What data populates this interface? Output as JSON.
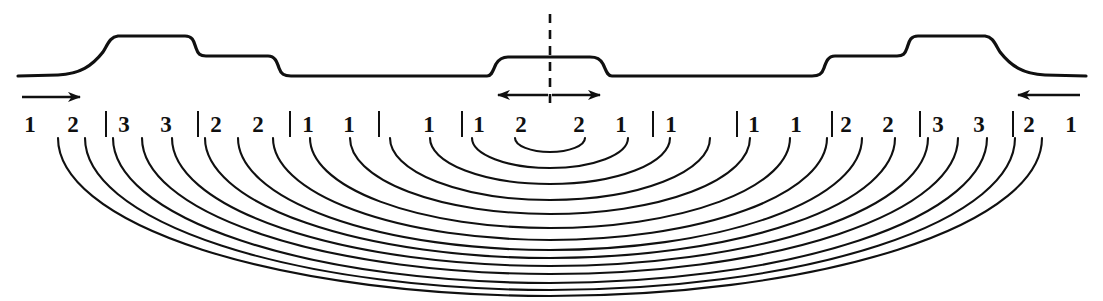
{
  "figure": {
    "background_color": "#ffffff",
    "ink_color": "#101010",
    "width": 1103,
    "height": 301
  },
  "surface_profile": {
    "name": "terrain-profile",
    "baseline_y": 76,
    "levels": {
      "baseline": 76,
      "low_step": 56,
      "high_step": 36,
      "center_bump": 57
    },
    "description": "Symmetric profile: outer baseline, gradual rise to high plateau, step down to mid plateau, long baseline, small central raised block, then mirrored on the right"
  },
  "centerline": {
    "name": "symmetry-axis",
    "x": 550,
    "y_top": 14,
    "y_bottom": 106,
    "style": "dashed"
  },
  "arrows": [
    {
      "name": "left-flow-arrow",
      "direction": "right",
      "x1": 22,
      "x2": 88,
      "y": 97
    },
    {
      "name": "center-left-flow-arrow",
      "direction": "left",
      "x1": 548,
      "x2": 490,
      "y": 95
    },
    {
      "name": "center-right-flow-arrow",
      "direction": "right",
      "x1": 552,
      "x2": 608,
      "y": 95
    },
    {
      "name": "right-flow-arrow",
      "direction": "left",
      "x1": 1080,
      "x2": 1010,
      "y": 95
    }
  ],
  "zone_labels": {
    "row_y": 124,
    "items": [
      {
        "kind": "number",
        "text": "1",
        "x": 30
      },
      {
        "kind": "number",
        "text": "2",
        "x": 73
      },
      {
        "kind": "divider",
        "text": "|",
        "x": 106
      },
      {
        "kind": "number",
        "text": "3",
        "x": 124
      },
      {
        "kind": "number",
        "text": "3",
        "x": 166
      },
      {
        "kind": "divider",
        "text": "|",
        "x": 198
      },
      {
        "kind": "number",
        "text": "2",
        "x": 216
      },
      {
        "kind": "number",
        "text": "2",
        "x": 258
      },
      {
        "kind": "divider",
        "text": "|",
        "x": 290
      },
      {
        "kind": "number",
        "text": "1",
        "x": 308
      },
      {
        "kind": "number",
        "text": "1",
        "x": 349
      },
      {
        "kind": "divider",
        "text": "|",
        "x": 379
      },
      {
        "kind": "number",
        "text": "1",
        "x": 429
      },
      {
        "kind": "divider",
        "text": "|",
        "x": 462
      },
      {
        "kind": "number",
        "text": "1",
        "x": 479
      },
      {
        "kind": "number",
        "text": "2",
        "x": 521
      },
      {
        "kind": "number",
        "text": "2",
        "x": 579
      },
      {
        "kind": "number",
        "text": "1",
        "x": 621
      },
      {
        "kind": "divider",
        "text": "|",
        "x": 653
      },
      {
        "kind": "number",
        "text": "1",
        "x": 671
      },
      {
        "kind": "divider",
        "text": "|",
        "x": 737
      },
      {
        "kind": "number",
        "text": "1",
        "x": 754
      },
      {
        "kind": "number",
        "text": "1",
        "x": 796
      },
      {
        "kind": "divider",
        "text": "|",
        "x": 832
      },
      {
        "kind": "number",
        "text": "2",
        "x": 846
      },
      {
        "kind": "number",
        "text": "2",
        "x": 888
      },
      {
        "kind": "divider",
        "text": "|",
        "x": 920
      },
      {
        "kind": "number",
        "text": "3",
        "x": 938
      },
      {
        "kind": "number",
        "text": "3",
        "x": 979
      },
      {
        "kind": "divider",
        "text": "|",
        "x": 1013
      },
      {
        "kind": "number",
        "text": "2",
        "x": 1029
      },
      {
        "kind": "number",
        "text": "1",
        "x": 1071
      }
    ]
  },
  "wavefront_arcs": {
    "name": "nested-wavefront-arcs",
    "center_x": 550,
    "center_y": 138,
    "count": 14,
    "radii_x": [
      35,
      78,
      120,
      160,
      200,
      240,
      277,
      312,
      345,
      378,
      408,
      437,
      465,
      492
    ],
    "radii_y": [
      14,
      30,
      46,
      62,
      76,
      90,
      102,
      112,
      120,
      128,
      136,
      145,
      152,
      158
    ],
    "description": "Family of concentric semi-elliptical arcs opening downward, each anchored near a numbered zone label"
  }
}
